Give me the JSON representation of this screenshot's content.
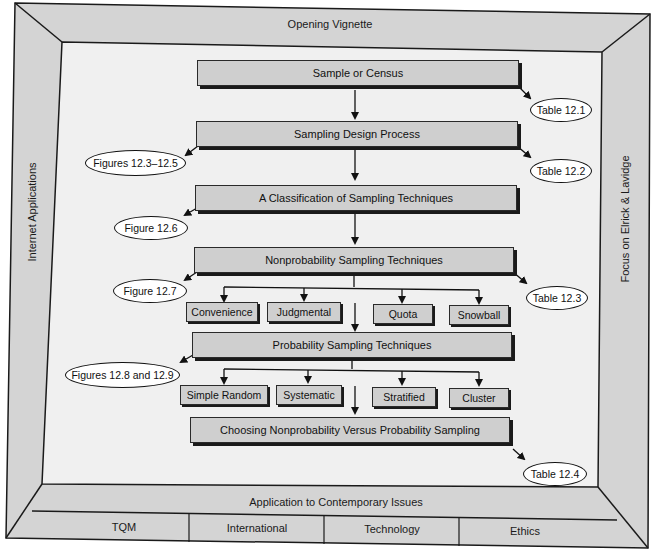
{
  "frame": {
    "top_label": "Opening Vignette",
    "left_label": "Internet Applications",
    "right_label": "Focus on Elrick & Lavidge",
    "bottom_label": "Application to Contemporary Issues",
    "bottom_cells": [
      "TQM",
      "International",
      "Technology",
      "Ethics"
    ],
    "colors": {
      "frame_fill": "#d4d4d4",
      "inner_fill": "#f2f2f2",
      "box_fill": "#cfcfcf",
      "stroke": "#1a1a1a"
    }
  },
  "flow": {
    "main_boxes": [
      "Sample or Census",
      "Sampling Design Process",
      "A Classification of Sampling Techniques",
      "Nonprobability Sampling Techniques",
      "Probability Sampling Techniques",
      "Choosing Nonprobability Versus Probability Sampling"
    ],
    "nonprobability_techniques": [
      "Convenience",
      "Judgmental",
      "Quota",
      "Snowball"
    ],
    "probability_techniques": [
      "Simple Random",
      "Systematic",
      "Stratified",
      "Cluster"
    ]
  },
  "references": {
    "table_12_1": "Table 12.1",
    "figures_12_3_12_5": "Figures 12.3–12.5",
    "table_12_2": "Table 12.2",
    "figure_12_6": "Figure 12.6",
    "figure_12_7": "Figure 12.7",
    "table_12_3": "Table 12.3",
    "figures_12_8_12_9": "Figures 12.8 and 12.9",
    "table_12_4": "Table 12.4"
  }
}
